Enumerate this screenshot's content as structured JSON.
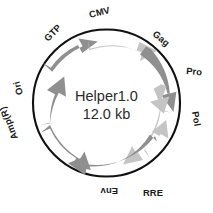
{
  "figure": {
    "type": "plasmid-map",
    "background_color": "#ffffff",
    "backbone_color": "#111111",
    "feature_color_dark": "#8f8f8f",
    "feature_color_light": "#c4c4c4"
  },
  "center": {
    "name": "Helper1.0",
    "size": "12.0 kb"
  },
  "features": [
    {
      "id": "gtp",
      "label": "GTP",
      "shade": "dark",
      "orientation": "clockwise"
    },
    {
      "id": "cmv",
      "label": "CMV",
      "shade": "light",
      "orientation": "clockwise"
    },
    {
      "id": "gag",
      "label": "Gag",
      "shade": "dark",
      "orientation": "clockwise"
    },
    {
      "id": "pro",
      "label": "Pro",
      "shade": "light",
      "orientation": "clockwise"
    },
    {
      "id": "pol",
      "label": "Pol",
      "shade": "light",
      "orientation": "clockwise"
    },
    {
      "id": "rre",
      "label": "RRE",
      "shade": "light",
      "orientation": "counterclockwise"
    },
    {
      "id": "env",
      "label": "Env",
      "shade": "dark",
      "orientation": "counterclockwise"
    },
    {
      "id": "ampr",
      "label": "Amp(R)",
      "shade": "dark",
      "orientation": "clockwise"
    },
    {
      "id": "ori",
      "label": "Ori",
      "shade": "dark",
      "orientation": "counterclockwise"
    }
  ]
}
